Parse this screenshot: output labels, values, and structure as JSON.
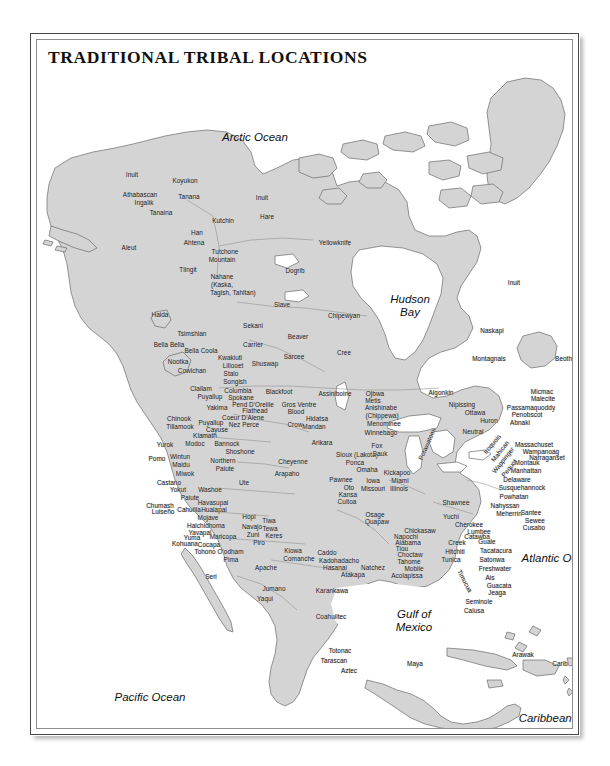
{
  "figure": {
    "title": "TRADITIONAL TRIBAL LOCATIONS",
    "kind": "reference-map",
    "region": "North America",
    "colors": {
      "land_fill": "#d4d4d4",
      "water_fill": "#ffffff",
      "coast_stroke": "#6a6a6a",
      "border_stroke": "#8c8c8c",
      "frame_outer": "#4a4a4a",
      "frame_inner": "#8e8e8e",
      "label_text": "#1b1b1b",
      "page_background": "#ffffff"
    }
  },
  "water_labels": [
    {
      "text": "Arctic Ocean",
      "x": 218,
      "y": 97,
      "lines": [
        "Arctic Ocean"
      ]
    },
    {
      "text": "Hudson Bay",
      "x": 373,
      "y": 266,
      "lines": [
        "Hudson",
        "Bay"
      ]
    },
    {
      "text": "Atlantic Ocean",
      "x": 522,
      "y": 518,
      "lines": [
        "Atlantic Ocean"
      ]
    },
    {
      "text": "Pacific Ocean",
      "x": 113,
      "y": 657,
      "lines": [
        "Pacific Ocean"
      ]
    },
    {
      "text": "Gulf of Mexico",
      "x": 377,
      "y": 581,
      "lines": [
        "Gulf of",
        "Mexico"
      ]
    },
    {
      "text": "Caribbean Sea",
      "x": 520,
      "y": 678,
      "lines": [
        "Caribbean Sea"
      ]
    }
  ],
  "tribe_labels": [
    {
      "name": "Inuit",
      "x": 95,
      "y": 135
    },
    {
      "name": "Koyukon",
      "x": 148,
      "y": 141
    },
    {
      "name": "Athabascan",
      "x": 103,
      "y": 155
    },
    {
      "name": "Ingalik",
      "x": 107,
      "y": 163
    },
    {
      "name": "Tanana",
      "x": 152,
      "y": 157
    },
    {
      "name": "Tanaina",
      "x": 124,
      "y": 173
    },
    {
      "name": "Inuit",
      "x": 225,
      "y": 158
    },
    {
      "name": "Kutchin",
      "x": 186,
      "y": 181
    },
    {
      "name": "Hare",
      "x": 230,
      "y": 177
    },
    {
      "name": "Han",
      "x": 160,
      "y": 193
    },
    {
      "name": "Ahtena",
      "x": 157,
      "y": 203
    },
    {
      "name": "Aleut",
      "x": 92,
      "y": 208
    },
    {
      "name": "Yellowknife",
      "x": 298,
      "y": 203
    },
    {
      "name": "Tutchone",
      "x": 188,
      "y": 212
    },
    {
      "name": "Mountain",
      "x": 185,
      "y": 220
    },
    {
      "name": "Tlingit",
      "x": 151,
      "y": 230
    },
    {
      "name": "Dogrib",
      "x": 258,
      "y": 231
    },
    {
      "name": "Nahane",
      "x": 185,
      "y": 237
    },
    {
      "name": "(Kaska,",
      "x": 185,
      "y": 245
    },
    {
      "name": "Tagish, Tahltan)",
      "x": 196,
      "y": 253
    },
    {
      "name": "Slave",
      "x": 245,
      "y": 265
    },
    {
      "name": "Inuit",
      "x": 477,
      "y": 243
    },
    {
      "name": "Chipewyan",
      "x": 307,
      "y": 276
    },
    {
      "name": "Haida",
      "x": 123,
      "y": 275
    },
    {
      "name": "Sekani",
      "x": 216,
      "y": 286
    },
    {
      "name": "Tsimshian",
      "x": 155,
      "y": 294
    },
    {
      "name": "Beaver",
      "x": 261,
      "y": 297
    },
    {
      "name": "Bella Bella",
      "x": 132,
      "y": 305
    },
    {
      "name": "Bella Coola",
      "x": 164,
      "y": 311
    },
    {
      "name": "Carrier",
      "x": 216,
      "y": 305
    },
    {
      "name": "Cree",
      "x": 307,
      "y": 313
    },
    {
      "name": "Naskapi",
      "x": 455,
      "y": 291
    },
    {
      "name": "Montagnais",
      "x": 452,
      "y": 319
    },
    {
      "name": "Beothuk",
      "x": 530,
      "y": 319
    },
    {
      "name": "Nootka",
      "x": 141,
      "y": 322
    },
    {
      "name": "Kwakiutl",
      "x": 193,
      "y": 318
    },
    {
      "name": "Sarcee",
      "x": 257,
      "y": 317
    },
    {
      "name": "Shuswap",
      "x": 228,
      "y": 324
    },
    {
      "name": "Lillooet",
      "x": 196,
      "y": 326
    },
    {
      "name": "Cowichan",
      "x": 155,
      "y": 331
    },
    {
      "name": "Stalo",
      "x": 194,
      "y": 334
    },
    {
      "name": "Songish",
      "x": 198,
      "y": 342
    },
    {
      "name": "Clallam",
      "x": 164,
      "y": 349
    },
    {
      "name": "Columbia",
      "x": 201,
      "y": 351
    },
    {
      "name": "Blackfoot",
      "x": 242,
      "y": 352
    },
    {
      "name": "Assiniboine",
      "x": 298,
      "y": 354
    },
    {
      "name": "Ojbwa",
      "x": 338,
      "y": 354
    },
    {
      "name": "Algonkin",
      "x": 404,
      "y": 353
    },
    {
      "name": "Micmac",
      "x": 505,
      "y": 352
    },
    {
      "name": "Malecite",
      "x": 506,
      "y": 359
    },
    {
      "name": "Puyallup",
      "x": 173,
      "y": 357
    },
    {
      "name": "Spokane",
      "x": 204,
      "y": 358
    },
    {
      "name": "Metis",
      "x": 336,
      "y": 361
    },
    {
      "name": "Pend D'Oreille",
      "x": 216,
      "y": 365
    },
    {
      "name": "Nipissing",
      "x": 425,
      "y": 365
    },
    {
      "name": "Anishinabe",
      "x": 344,
      "y": 368
    },
    {
      "name": "Gros Ventre",
      "x": 262,
      "y": 365
    },
    {
      "name": "Passamaquoddy",
      "x": 494,
      "y": 368
    },
    {
      "name": "Yakima",
      "x": 180,
      "y": 368
    },
    {
      "name": "Flathead",
      "x": 218,
      "y": 371
    },
    {
      "name": "Blood",
      "x": 259,
      "y": 372
    },
    {
      "name": "Ottawa",
      "x": 438,
      "y": 373
    },
    {
      "name": "Penobscot",
      "x": 490,
      "y": 375
    },
    {
      "name": "(Chippewa)",
      "x": 345,
      "y": 376
    },
    {
      "name": "Coeur D'Alene",
      "x": 206,
      "y": 378
    },
    {
      "name": "Hidatsa",
      "x": 280,
      "y": 379
    },
    {
      "name": "Chinook",
      "x": 142,
      "y": 379
    },
    {
      "name": "Huron",
      "x": 452,
      "y": 381
    },
    {
      "name": "Abnaki",
      "x": 483,
      "y": 383
    },
    {
      "name": "Puyallup",
      "x": 174,
      "y": 383
    },
    {
      "name": "Nez Perce",
      "x": 207,
      "y": 385
    },
    {
      "name": "Crow",
      "x": 258,
      "y": 385
    },
    {
      "name": "Menominee",
      "x": 347,
      "y": 384
    },
    {
      "name": "Tillamook",
      "x": 143,
      "y": 387
    },
    {
      "name": "Cayuse",
      "x": 180,
      "y": 390
    },
    {
      "name": "Mandan",
      "x": 277,
      "y": 387
    },
    {
      "name": "Klamath",
      "x": 168,
      "y": 396
    },
    {
      "name": "Winnebago",
      "x": 344,
      "y": 393
    },
    {
      "name": "Neutral",
      "x": 436,
      "y": 392
    },
    {
      "name": "Yurok",
      "x": 128,
      "y": 405
    },
    {
      "name": "Modoc",
      "x": 158,
      "y": 404
    },
    {
      "name": "Bannock",
      "x": 190,
      "y": 404
    },
    {
      "name": "Arikara",
      "x": 285,
      "y": 403
    },
    {
      "name": "Massachuset",
      "x": 497,
      "y": 405
    },
    {
      "name": "Fox",
      "x": 340,
      "y": 406
    },
    {
      "name": "Wampanoag",
      "x": 504,
      "y": 412
    },
    {
      "name": "Pomo",
      "x": 120,
      "y": 419
    },
    {
      "name": "Wintun",
      "x": 143,
      "y": 417
    },
    {
      "name": "Shoshone",
      "x": 203,
      "y": 412
    },
    {
      "name": "Sioux (Lakota)",
      "x": 320,
      "y": 415
    },
    {
      "name": "Sauk",
      "x": 343,
      "y": 414
    },
    {
      "name": "Narraganset",
      "x": 510,
      "y": 418
    },
    {
      "name": "Maidu",
      "x": 144,
      "y": 425
    },
    {
      "name": "Northern",
      "x": 186,
      "y": 421
    },
    {
      "name": "Cheyenne",
      "x": 256,
      "y": 422
    },
    {
      "name": "Ponca",
      "x": 318,
      "y": 423
    },
    {
      "name": "Montauk",
      "x": 490,
      "y": 423
    },
    {
      "name": "Paiute",
      "x": 188,
      "y": 429
    },
    {
      "name": "Omaha",
      "x": 330,
      "y": 430
    },
    {
      "name": "Manhattan",
      "x": 489,
      "y": 431
    },
    {
      "name": "Miwok",
      "x": 148,
      "y": 434
    },
    {
      "name": "Arapaho",
      "x": 250,
      "y": 434
    },
    {
      "name": "Delaware",
      "x": 480,
      "y": 440
    },
    {
      "name": "Kickapoo",
      "x": 360,
      "y": 433
    },
    {
      "name": "Castano",
      "x": 132,
      "y": 443
    },
    {
      "name": "Ute",
      "x": 207,
      "y": 443
    },
    {
      "name": "Pawnee",
      "x": 304,
      "y": 440
    },
    {
      "name": "Miami",
      "x": 363,
      "y": 441
    },
    {
      "name": "Iowa",
      "x": 336,
      "y": 441
    },
    {
      "name": "Yokut",
      "x": 141,
      "y": 450
    },
    {
      "name": "Washoe",
      "x": 173,
      "y": 450
    },
    {
      "name": "Oto",
      "x": 312,
      "y": 448
    },
    {
      "name": "Missouri",
      "x": 336,
      "y": 449
    },
    {
      "name": "Illinois",
      "x": 362,
      "y": 449
    },
    {
      "name": "Susquehannock",
      "x": 485,
      "y": 448
    },
    {
      "name": "Paiute",
      "x": 153,
      "y": 458
    },
    {
      "name": "Kansa",
      "x": 311,
      "y": 455
    },
    {
      "name": "Powhatan",
      "x": 477,
      "y": 457
    },
    {
      "name": "Chumash",
      "x": 123,
      "y": 466
    },
    {
      "name": "Havasupai",
      "x": 176,
      "y": 463
    },
    {
      "name": "Cuitoa",
      "x": 310,
      "y": 462
    },
    {
      "name": "Shawnee",
      "x": 419,
      "y": 463
    },
    {
      "name": "Luiseño",
      "x": 126,
      "y": 472
    },
    {
      "name": "Cahuilla",
      "x": 152,
      "y": 470
    },
    {
      "name": "Hualapai",
      "x": 177,
      "y": 470
    },
    {
      "name": "Nahyssan",
      "x": 468,
      "y": 466
    },
    {
      "name": "Meherrin",
      "x": 472,
      "y": 474
    },
    {
      "name": "Mojave",
      "x": 171,
      "y": 478
    },
    {
      "name": "Hopi",
      "x": 212,
      "y": 477
    },
    {
      "name": "Osage",
      "x": 338,
      "y": 475
    },
    {
      "name": "Yuchi",
      "x": 414,
      "y": 477
    },
    {
      "name": "Santee",
      "x": 494,
      "y": 473
    },
    {
      "name": "Sewee",
      "x": 498,
      "y": 481
    },
    {
      "name": "Halchidhoma",
      "x": 169,
      "y": 486
    },
    {
      "name": "Navajo",
      "x": 215,
      "y": 487
    },
    {
      "name": "Quapaw",
      "x": 340,
      "y": 482
    },
    {
      "name": "Cherokee",
      "x": 432,
      "y": 485
    },
    {
      "name": "Cusabo",
      "x": 497,
      "y": 488
    },
    {
      "name": "Tiwa",
      "x": 232,
      "y": 481
    },
    {
      "name": "Yavapai",
      "x": 163,
      "y": 493
    },
    {
      "name": "Tewa",
      "x": 233,
      "y": 489
    },
    {
      "name": "Zuni",
      "x": 216,
      "y": 495
    },
    {
      "name": "Keres",
      "x": 237,
      "y": 496
    },
    {
      "name": "Chickasaw",
      "x": 383,
      "y": 491
    },
    {
      "name": "Lumbee",
      "x": 442,
      "y": 492
    },
    {
      "name": "Yuma",
      "x": 155,
      "y": 498
    },
    {
      "name": "Maricopa",
      "x": 186,
      "y": 497
    },
    {
      "name": "Napochi",
      "x": 369,
      "y": 497
    },
    {
      "name": "Catawba",
      "x": 440,
      "y": 497
    },
    {
      "name": "Kohuana",
      "x": 148,
      "y": 504
    },
    {
      "name": "Cocapa",
      "x": 172,
      "y": 505
    },
    {
      "name": "Piro",
      "x": 222,
      "y": 503
    },
    {
      "name": "Alabama",
      "x": 371,
      "y": 503
    },
    {
      "name": "Creek",
      "x": 420,
      "y": 503
    },
    {
      "name": "Guale",
      "x": 450,
      "y": 502
    },
    {
      "name": "Tohono O'odham",
      "x": 182,
      "y": 512
    },
    {
      "name": "Tiou",
      "x": 365,
      "y": 509
    },
    {
      "name": "Hitchiti",
      "x": 418,
      "y": 512
    },
    {
      "name": "Tacatacura",
      "x": 459,
      "y": 511
    },
    {
      "name": "Kiowa",
      "x": 256,
      "y": 511
    },
    {
      "name": "Caddo",
      "x": 290,
      "y": 513
    },
    {
      "name": "Choctaw",
      "x": 373,
      "y": 515
    },
    {
      "name": "Pima",
      "x": 194,
      "y": 520
    },
    {
      "name": "Comanche",
      "x": 262,
      "y": 519
    },
    {
      "name": "Kadohadacho",
      "x": 302,
      "y": 521
    },
    {
      "name": "Tahome",
      "x": 372,
      "y": 522
    },
    {
      "name": "Tunica",
      "x": 414,
      "y": 520
    },
    {
      "name": "Satonwa",
      "x": 455,
      "y": 520
    },
    {
      "name": "Apache",
      "x": 229,
      "y": 528
    },
    {
      "name": "Hasanai",
      "x": 298,
      "y": 528
    },
    {
      "name": "Natchez",
      "x": 336,
      "y": 528
    },
    {
      "name": "Mobile",
      "x": 377,
      "y": 529
    },
    {
      "name": "Freshwater",
      "x": 458,
      "y": 529
    },
    {
      "name": "Seri",
      "x": 174,
      "y": 537
    },
    {
      "name": "Atakapa",
      "x": 316,
      "y": 535
    },
    {
      "name": "Acolapissa",
      "x": 370,
      "y": 536
    },
    {
      "name": "Ais",
      "x": 453,
      "y": 538
    },
    {
      "name": "Guacata",
      "x": 462,
      "y": 546
    },
    {
      "name": "Jumano",
      "x": 237,
      "y": 549
    },
    {
      "name": "Karankawa",
      "x": 295,
      "y": 551
    },
    {
      "name": "Jeaga",
      "x": 460,
      "y": 553
    },
    {
      "name": "Yaqui",
      "x": 228,
      "y": 559
    },
    {
      "name": "Seminole",
      "x": 442,
      "y": 562
    },
    {
      "name": "Calusa",
      "x": 437,
      "y": 571
    },
    {
      "name": "Coahuiltec",
      "x": 294,
      "y": 577
    },
    {
      "name": "Arawak",
      "x": 486,
      "y": 615
    },
    {
      "name": "Totonac",
      "x": 303,
      "y": 611
    },
    {
      "name": "Carib",
      "x": 523,
      "y": 624
    },
    {
      "name": "Tarascan",
      "x": 297,
      "y": 621
    },
    {
      "name": "Maya",
      "x": 378,
      "y": 624
    },
    {
      "name": "Aztec",
      "x": 312,
      "y": 631
    },
    {
      "name": "Cuna",
      "x": 467,
      "y": 707
    }
  ],
  "rotated_labels": [
    {
      "name": "Potawatomi",
      "x": 390,
      "y": 404,
      "angle": -66
    },
    {
      "name": "Iroquois",
      "x": 455,
      "y": 404,
      "angle": -50
    },
    {
      "name": "Mahican",
      "x": 463,
      "y": 411,
      "angle": -52
    },
    {
      "name": "Wappinger",
      "x": 466,
      "y": 420,
      "angle": -52
    },
    {
      "name": "Pequot",
      "x": 472,
      "y": 428,
      "angle": -52
    },
    {
      "name": "Timucua",
      "x": 428,
      "y": 541,
      "angle": 62
    }
  ]
}
